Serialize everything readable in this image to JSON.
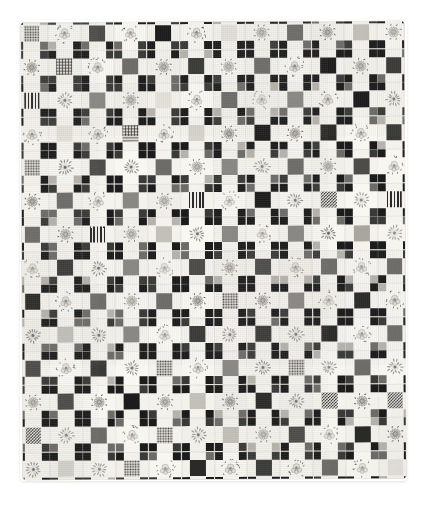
{
  "image": {
    "subject": "Nine-Patch and Floral Album quilt",
    "background_color": "#ffffff",
    "quilt_ground_color": "#f4f2ed",
    "dark_patch_color": "#1c1c1c",
    "alt_text": "Photograph of a nine-patch album quilt with alternating dark center squares and embroidered floral blocks on a white ground"
  },
  "quilt": {
    "columns": 12,
    "rows": 14,
    "block_size_px": 32.8,
    "left_px": 22,
    "top_px": 22,
    "width_px": 383,
    "height_px": 457,
    "block_types": [
      "nine-patch",
      "floral"
    ],
    "palette": {
      "ground": "#f4f2ed",
      "floral_ground": "#f7f5f1",
      "near_black": "#1c1c1c",
      "dark_gray": "#3a3a38",
      "mid_gray": "#6e6c68",
      "light_gray": "#b6b3ad",
      "pale_gray": "#d6d3cd",
      "corner_dark": "#242424"
    },
    "center_fills": [
      "#1c1c1c",
      "#2a2a28",
      "#3a3a38",
      "#4d4c49",
      "#6e6c68",
      "#8a8883",
      "#a9a69f",
      "#c3c0b9",
      "#d6d3cd",
      "#e4e1db",
      "pat-check",
      "pat-stripe",
      "pat-dot",
      "pat-grid"
    ],
    "layout_note": "Checkerboard alternation: block is nine-patch when (row+col) is even, floral when odd"
  },
  "render_seed": 20240517
}
